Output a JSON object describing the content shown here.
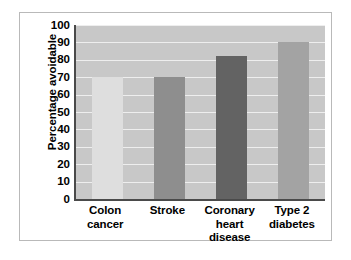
{
  "chart_data": {
    "type": "bar",
    "title": "",
    "subtitle": "",
    "xlabel": "",
    "ylabel": "Percentage avoidable",
    "categories": [
      "Colon cancer",
      "Stroke",
      "Coronary heart disease",
      "Type 2 diabetes"
    ],
    "values": [
      70,
      70,
      82,
      90
    ],
    "ylim": [
      0,
      100
    ],
    "ytick_step": 10,
    "yticks": [
      0,
      10,
      20,
      30,
      40,
      50,
      60,
      70,
      80,
      90,
      100
    ],
    "ytick_labels": [
      "0",
      "10",
      "20",
      "30",
      "40",
      "50",
      "60",
      "70",
      "80",
      "90",
      "100"
    ],
    "grid": true,
    "grid_axis": "y",
    "grid_color": "#eeeeee",
    "legend": false,
    "legend_position": "none",
    "plot_background": "#c8c8c8",
    "axis_color": "#4a4a4a",
    "figure_border_color": "#b9b9b9",
    "bar_colors": [
      "#dedede",
      "#8e8e8e",
      "#636363",
      "#a3a3a3"
    ],
    "bars": [
      {
        "label": "Colon cancer",
        "label_lines": [
          "Colon",
          "cancer"
        ],
        "value": 70,
        "color": "#dedede"
      },
      {
        "label": "Stroke",
        "label_lines": [
          "Stroke"
        ],
        "value": 70,
        "color": "#8e8e8e"
      },
      {
        "label": "Coronary heart disease",
        "label_lines": [
          "Coronary",
          "heart",
          "disease"
        ],
        "value": 82,
        "color": "#636363"
      },
      {
        "label": "Type 2 diabetes",
        "label_lines": [
          "Type 2",
          "diabetes"
        ],
        "value": 90,
        "color": "#a3a3a3"
      }
    ]
  }
}
